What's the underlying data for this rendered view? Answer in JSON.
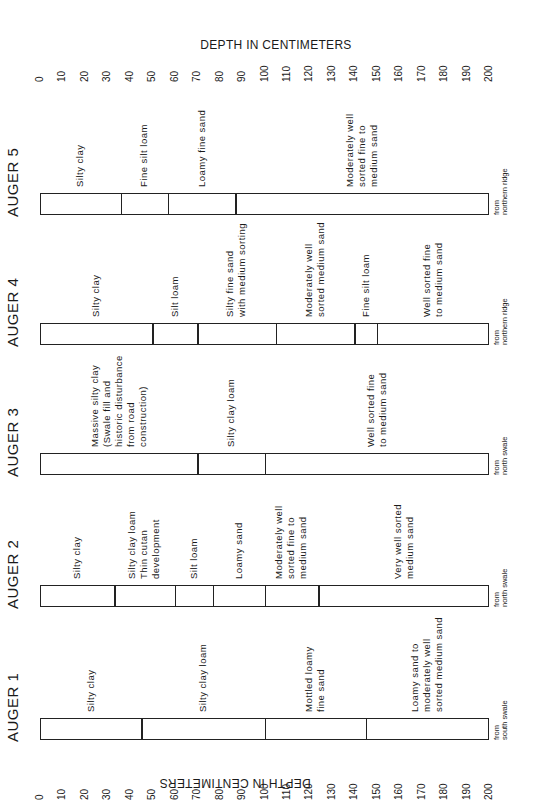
{
  "axis": {
    "title_top": "DEPTH IN CENTIMETERS",
    "title_bottom": "DEPTH IN CENTIMETERS",
    "ticks": [
      "0",
      "10",
      "20",
      "30",
      "40",
      "50",
      "60",
      "70",
      "80",
      "90",
      "100",
      "110",
      "120",
      "130",
      "140",
      "150",
      "160",
      "170",
      "180",
      "190",
      "200"
    ],
    "min": 0,
    "max": 200,
    "unit": "cm"
  },
  "augers": [
    {
      "title": "AUGER 1",
      "source": "from\nsouth swale",
      "boundaries_cm": [
        45,
        100,
        145
      ],
      "layers": [
        {
          "label": "Silty clay",
          "top_cm": 0,
          "bottom_cm": 45
        },
        {
          "label": "Silty clay loam",
          "top_cm": 45,
          "bottom_cm": 100
        },
        {
          "label": "Mottled loamy\nfine sand",
          "top_cm": 100,
          "bottom_cm": 145
        },
        {
          "label": "Loamy sand to\nmoderately well\nsorted medium sand",
          "top_cm": 145,
          "bottom_cm": 200
        }
      ]
    },
    {
      "title": "AUGER 2",
      "source": "from\nnorth swale",
      "boundaries_cm": [
        33,
        60,
        77,
        100,
        124
      ],
      "layers": [
        {
          "label": "Silty clay",
          "top_cm": 0,
          "bottom_cm": 33
        },
        {
          "label": "Silty clay loam\nThin cutan\ndevelopment",
          "top_cm": 33,
          "bottom_cm": 60
        },
        {
          "label": "Silt loam",
          "top_cm": 60,
          "bottom_cm": 77
        },
        {
          "label": "Loamy sand",
          "top_cm": 77,
          "bottom_cm": 100
        },
        {
          "label": "Moderately well\nsorted fine to\nmedium sand",
          "top_cm": 100,
          "bottom_cm": 124
        },
        {
          "label": "Very well sorted\nmedium sand",
          "top_cm": 124,
          "bottom_cm": 200
        }
      ]
    },
    {
      "title": "AUGER 3",
      "source": "from\nnorth swale",
      "boundaries_cm": [
        70,
        100
      ],
      "layers": [
        {
          "label": "Massive silty clay\n(Swale fill and\nhistoric disturbance\nfrom road\nconstruction)",
          "top_cm": 0,
          "bottom_cm": 70
        },
        {
          "label": "Silty clay loam",
          "top_cm": 70,
          "bottom_cm": 100
        },
        {
          "label": "Well sorted fine\nto medium sand",
          "top_cm": 100,
          "bottom_cm": 200
        }
      ]
    },
    {
      "title": "AUGER 4",
      "source": "from\nnorthern ridge",
      "boundaries_cm": [
        50,
        70,
        105,
        140,
        150
      ],
      "layers": [
        {
          "label": "Silty clay",
          "top_cm": 0,
          "bottom_cm": 50
        },
        {
          "label": "Silt loam",
          "top_cm": 50,
          "bottom_cm": 70
        },
        {
          "label": "Silty fine sand\nwith medium sorting",
          "top_cm": 70,
          "bottom_cm": 105
        },
        {
          "label": "Moderately well\nsorted medium sand",
          "top_cm": 105,
          "bottom_cm": 140
        },
        {
          "label": "Fine silt loam",
          "top_cm": 140,
          "bottom_cm": 150
        },
        {
          "label": "Well sorted fine\nto medium sand",
          "top_cm": 150,
          "bottom_cm": 200
        }
      ]
    },
    {
      "title": "AUGER 5",
      "source": "from\nnorthern ridge",
      "boundaries_cm": [
        36,
        57,
        87
      ],
      "layers": [
        {
          "label": "Silty clay",
          "top_cm": 0,
          "bottom_cm": 36
        },
        {
          "label": "Fine silt loam",
          "top_cm": 36,
          "bottom_cm": 57
        },
        {
          "label": "Loamy fine sand",
          "top_cm": 57,
          "bottom_cm": 87
        },
        {
          "label": "Moderately well\nsorted fine to\nmedium sand",
          "top_cm": 87,
          "bottom_cm": 200
        }
      ]
    }
  ],
  "colors": {
    "ink": "#222222",
    "background": "#ffffff"
  }
}
